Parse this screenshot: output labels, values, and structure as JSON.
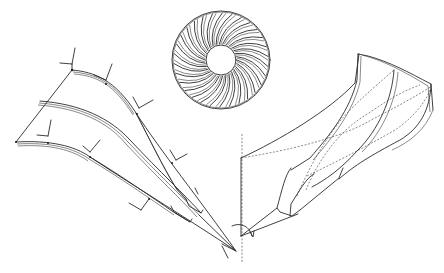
{
  "figure": {
    "type": "patent-line-drawing",
    "colors": {
      "background": "#ffffff",
      "line": "#2a2a2a"
    }
  },
  "panels": {
    "blade_section": {
      "label": "",
      "frames": [
        {
          "x": 72,
          "y": 70
        },
        {
          "x": 106,
          "y": 84
        },
        {
          "x": 137,
          "y": 114
        },
        {
          "x": 16,
          "y": 142
        },
        {
          "x": 90,
          "y": 157
        },
        {
          "x": 149,
          "y": 199
        },
        {
          "x": 172,
          "y": 163
        }
      ]
    },
    "rotor_wheel": {
      "label": "",
      "blade_count": 30
    },
    "blade_3d": {
      "label": ""
    }
  }
}
